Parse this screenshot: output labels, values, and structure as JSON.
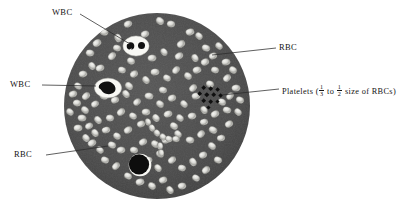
{
  "figure": {
    "field": {
      "shape": "circle",
      "center_x": 157,
      "center_y": 106,
      "radius": 93,
      "background_color": "#4d4d4d",
      "page_background": "#ffffff"
    },
    "colors": {
      "field": "#4d4d4d",
      "field_dark": "#3f3f3f",
      "rbc_fill": "#d8d8d4",
      "rbc_center": "#8e8e8a",
      "rbc_edge": "#f2f2ee",
      "wbc_cytoplasm": "#f7f7f3",
      "wbc_nucleus": "#141414",
      "platelet": "#101010",
      "leader_line": "#2b2b2b",
      "label_text": "#141414"
    }
  },
  "labels": {
    "wbc_top": {
      "text": "WBC",
      "leader_from": [
        80,
        14
      ],
      "leader_to": [
        128,
        45
      ]
    },
    "wbc_left": {
      "text": "WBC",
      "leader_from": [
        42,
        85
      ],
      "leader_to": [
        96,
        86
      ]
    },
    "rbc_left": {
      "text": "RBC",
      "leader_from": [
        46,
        155
      ],
      "leader_to": [
        107,
        146
      ]
    },
    "rbc_right": {
      "text": "RBC",
      "leader_from": [
        276,
        48
      ],
      "leader_to": [
        212,
        55
      ]
    },
    "platelets": {
      "prefix": "Platelets (",
      "fraction_1_num": "1",
      "fraction_1_den": "3",
      "middle": " to ",
      "fraction_2_num": "1",
      "fraction_2_den": "2",
      "suffix": " size of RBCs)",
      "leader_from": [
        279,
        89
      ],
      "leader_to": [
        223,
        95
      ]
    }
  },
  "cells": {
    "wbc_neutrophil": {
      "name": "neutrophil",
      "cx": 136,
      "cy": 46,
      "rx": 12.5,
      "ry": 9.5,
      "nuclei": [
        {
          "cx": 131,
          "cy": 46,
          "r": 3.6
        },
        {
          "cx": 142,
          "cy": 46,
          "r": 3.4
        }
      ]
    },
    "wbc_monocyte": {
      "name": "monocyte",
      "cx": 108,
      "cy": 88,
      "rx": 13,
      "ry": 9.5,
      "nucleus": "kidney-shaped"
    },
    "wbc_dark": {
      "name": "large-dark-leukocyte",
      "cx": 140,
      "cy": 165,
      "r": 11
    },
    "platelet_cluster": {
      "cx": 210,
      "cy": 96,
      "count": 11
    },
    "rbc_count": 118,
    "rbc_radius_x": 4.3,
    "rbc_radius_y": 3.3
  }
}
